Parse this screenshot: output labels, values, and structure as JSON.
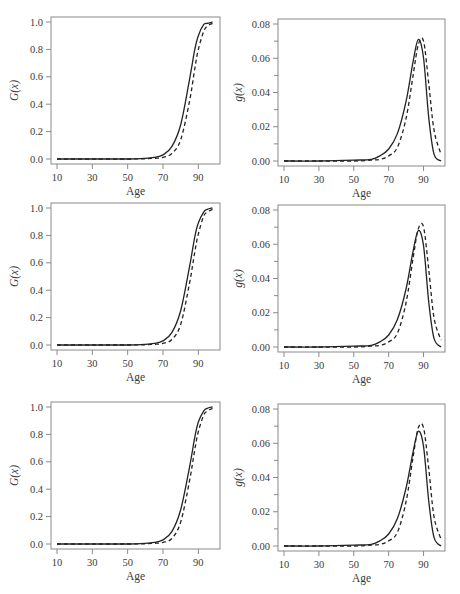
{
  "figure": {
    "layout": {
      "rows": 3,
      "cols": 2
    },
    "line_styles": {
      "series_1": "solid",
      "series_2": "dashed"
    },
    "line_color": "#222222",
    "frame_color": "#8a8a8a"
  },
  "panels": [
    {
      "id": "cdf",
      "xlabel": "Age",
      "ylabel": "G(x)",
      "xticks": [
        "10",
        "30",
        "50",
        "70",
        "90"
      ],
      "yticks": [
        "0.0",
        "0.2",
        "0.4",
        "0.6",
        "0.8",
        "1.0"
      ]
    },
    {
      "id": "pdf",
      "xlabel": "Age",
      "ylabel": "g(x)",
      "xticks": [
        "10",
        "30",
        "50",
        "70",
        "90"
      ],
      "yticks": [
        "0.00",
        "0.02",
        "0.04",
        "0.06",
        "0.08"
      ]
    },
    {
      "id": "cdf",
      "xlabel": "Age",
      "ylabel": "G(x)",
      "xticks": [
        "10",
        "30",
        "50",
        "70",
        "90"
      ],
      "yticks": [
        "0.0",
        "0.2",
        "0.4",
        "0.6",
        "0.8",
        "1.0"
      ]
    },
    {
      "id": "pdf",
      "xlabel": "Age",
      "ylabel": "g(x)",
      "xticks": [
        "10",
        "30",
        "50",
        "70",
        "90"
      ],
      "yticks": [
        "0.00",
        "0.02",
        "0.04",
        "0.06",
        "0.08"
      ]
    },
    {
      "id": "cdf",
      "xlabel": "Age",
      "ylabel": "G(x)",
      "xticks": [
        "10",
        "30",
        "50",
        "70",
        "90"
      ],
      "yticks": [
        "0.0",
        "0.2",
        "0.4",
        "0.6",
        "0.8",
        "1.0"
      ]
    },
    {
      "id": "pdf",
      "xlabel": "Age",
      "ylabel": "g(x)",
      "xticks": [
        "10",
        "30",
        "50",
        "70",
        "90"
      ],
      "yticks": [
        "0.00",
        "0.02",
        "0.04",
        "0.06",
        "0.08"
      ]
    }
  ],
  "chart_data": [
    {
      "type": "line",
      "title": "",
      "xlabel": "Age",
      "ylabel": "G(x)",
      "xlim": [
        10,
        100
      ],
      "ylim": [
        0,
        1.0
      ],
      "grid": false,
      "legend": "none",
      "x": [
        10,
        30,
        50,
        60,
        65,
        70,
        75,
        80,
        85,
        88,
        90,
        93,
        95,
        98
      ],
      "series": [
        {
          "name": "solid",
          "values": [
            0.0,
            0.0,
            0.0,
            0.005,
            0.012,
            0.03,
            0.09,
            0.25,
            0.58,
            0.8,
            0.9,
            0.98,
            0.99,
            1.0
          ]
        },
        {
          "name": "dashed",
          "values": [
            0.0,
            0.0,
            0.0,
            0.002,
            0.005,
            0.012,
            0.04,
            0.14,
            0.42,
            0.66,
            0.8,
            0.93,
            0.97,
            0.99
          ]
        }
      ]
    },
    {
      "type": "line",
      "title": "",
      "xlabel": "Age",
      "ylabel": "g(x)",
      "xlim": [
        10,
        100
      ],
      "ylim": [
        0,
        0.08
      ],
      "grid": false,
      "legend": "none",
      "x": [
        10,
        30,
        50,
        60,
        65,
        70,
        75,
        80,
        84,
        87,
        90,
        93,
        96,
        100
      ],
      "series": [
        {
          "name": "solid",
          "values": [
            0.0,
            0.0,
            0.0005,
            0.001,
            0.003,
            0.007,
            0.016,
            0.035,
            0.058,
            0.071,
            0.06,
            0.025,
            0.004,
            0.0
          ]
        },
        {
          "name": "dashed",
          "values": [
            0.0,
            0.0,
            0.0,
            0.0005,
            0.001,
            0.003,
            0.008,
            0.025,
            0.05,
            0.068,
            0.07,
            0.045,
            0.018,
            0.004
          ]
        }
      ]
    },
    {
      "type": "line",
      "title": "",
      "xlabel": "Age",
      "ylabel": "G(x)",
      "xlim": [
        10,
        100
      ],
      "ylim": [
        0,
        1.0
      ],
      "grid": false,
      "legend": "none",
      "x": [
        10,
        30,
        50,
        60,
        65,
        70,
        75,
        80,
        85,
        88,
        90,
        93,
        95,
        98
      ],
      "series": [
        {
          "name": "solid",
          "values": [
            0.0,
            0.0,
            0.0,
            0.005,
            0.012,
            0.03,
            0.09,
            0.25,
            0.57,
            0.79,
            0.89,
            0.97,
            0.99,
            1.0
          ]
        },
        {
          "name": "dashed",
          "values": [
            0.0,
            0.0,
            0.0,
            0.002,
            0.005,
            0.012,
            0.04,
            0.15,
            0.45,
            0.68,
            0.81,
            0.94,
            0.97,
            0.99
          ]
        }
      ]
    },
    {
      "type": "line",
      "title": "",
      "xlabel": "Age",
      "ylabel": "g(x)",
      "xlim": [
        10,
        100
      ],
      "ylim": [
        0,
        0.08
      ],
      "grid": false,
      "legend": "none",
      "x": [
        10,
        30,
        50,
        60,
        65,
        70,
        75,
        80,
        84,
        87,
        90,
        93,
        96,
        100
      ],
      "series": [
        {
          "name": "solid",
          "values": [
            0.0,
            0.0,
            0.0005,
            0.001,
            0.003,
            0.007,
            0.016,
            0.034,
            0.056,
            0.068,
            0.059,
            0.026,
            0.005,
            0.0
          ]
        },
        {
          "name": "dashed",
          "values": [
            0.0,
            0.0,
            0.0,
            0.0005,
            0.001,
            0.003,
            0.008,
            0.026,
            0.052,
            0.069,
            0.07,
            0.045,
            0.017,
            0.004
          ]
        }
      ]
    },
    {
      "type": "line",
      "title": "",
      "xlabel": "Age",
      "ylabel": "G(x)",
      "xlim": [
        10,
        100
      ],
      "ylim": [
        0,
        1.0
      ],
      "grid": false,
      "legend": "none",
      "x": [
        10,
        30,
        50,
        60,
        65,
        70,
        75,
        80,
        85,
        88,
        90,
        93,
        95,
        98
      ],
      "series": [
        {
          "name": "solid",
          "values": [
            0.0,
            0.0,
            0.0,
            0.005,
            0.012,
            0.03,
            0.09,
            0.25,
            0.56,
            0.78,
            0.89,
            0.97,
            0.99,
            1.0
          ]
        },
        {
          "name": "dashed",
          "values": [
            0.0,
            0.0,
            0.0,
            0.002,
            0.005,
            0.012,
            0.04,
            0.16,
            0.46,
            0.69,
            0.82,
            0.94,
            0.97,
            0.99
          ]
        }
      ]
    },
    {
      "type": "line",
      "title": "",
      "xlabel": "Age",
      "ylabel": "g(x)",
      "xlim": [
        10,
        100
      ],
      "ylim": [
        0,
        0.08
      ],
      "grid": false,
      "legend": "none",
      "x": [
        10,
        30,
        50,
        60,
        65,
        70,
        75,
        80,
        84,
        87,
        90,
        93,
        96,
        100
      ],
      "series": [
        {
          "name": "solid",
          "values": [
            0.0,
            0.0,
            0.0005,
            0.001,
            0.003,
            0.007,
            0.016,
            0.034,
            0.055,
            0.067,
            0.058,
            0.026,
            0.005,
            0.0
          ]
        },
        {
          "name": "dashed",
          "values": [
            0.0,
            0.0,
            0.0,
            0.0005,
            0.001,
            0.003,
            0.008,
            0.026,
            0.052,
            0.069,
            0.069,
            0.045,
            0.017,
            0.004
          ]
        }
      ]
    }
  ]
}
